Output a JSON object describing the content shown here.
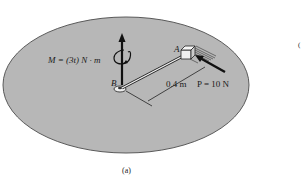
{
  "figure": {
    "caption": "(a)",
    "colors": {
      "disk_fill": "#b7b7b7",
      "disk_stroke": "#5a5a5a",
      "ink": "#1a1a1a",
      "background": "#ffffff"
    },
    "labels": {
      "moment": "M = (3t) N · m",
      "point_a": "A",
      "point_b": "B",
      "distance": "0.4 m",
      "force": "P = 10 N"
    },
    "margin_mark": "("
  }
}
